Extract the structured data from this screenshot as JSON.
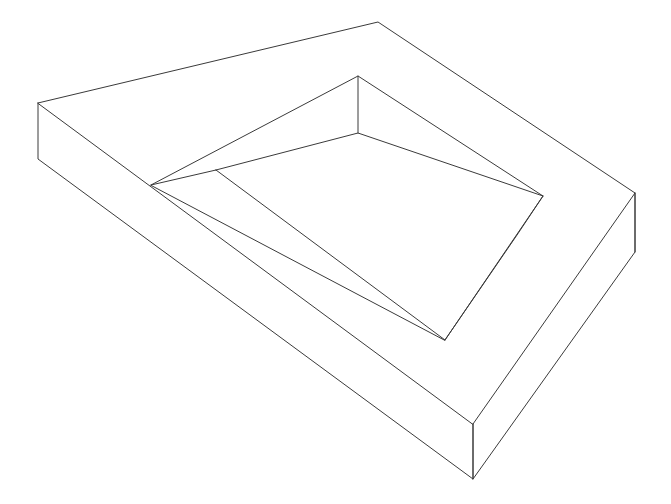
{
  "drawing": {
    "title": "Isometric rectangular tray",
    "description": "Wireframe line drawing of an open-top rectangular tray (pocketed block) shown in oblique isometric projection",
    "background_color": "#ffffff",
    "stroke_color": "#3a3a3a",
    "stroke_width": 1,
    "canvas": {
      "width": 671,
      "height": 504
    },
    "projection": "isometric",
    "extrusion_depth_px": 55
  },
  "chart_data": {
    "type": "line",
    "xlabel": "",
    "ylabel": "",
    "xlim": [
      0,
      671
    ],
    "ylim": [
      0,
      504
    ],
    "grid": false,
    "legend": "none",
    "vertices": {
      "outer_top_left": [
        38,
        103
      ],
      "outer_top_apex": [
        378,
        22
      ],
      "outer_top_right": [
        635,
        193
      ],
      "outer_top_bottom": [
        473,
        424
      ],
      "outer_base_left": [
        38,
        159
      ],
      "outer_base_right": [
        635,
        252
      ],
      "outer_base_bottom": [
        473,
        479
      ],
      "rim_left": [
        151,
        185
      ],
      "rim_apex": [
        358,
        76
      ],
      "rim_right": [
        543,
        196
      ],
      "rim_bottom": [
        445,
        340
      ],
      "wall_inner_apex": [
        358,
        133
      ],
      "floor_branch": [
        216,
        170
      ],
      "floor_right_corner": [
        517,
        235
      ]
    },
    "series": [
      {
        "name": "outer-top-face",
        "closed": true,
        "points": [
          [
            38,
            103
          ],
          [
            378,
            22
          ],
          [
            635,
            193
          ],
          [
            473,
            424
          ]
        ]
      },
      {
        "name": "outer-left-front-wall",
        "closed": false,
        "points": [
          [
            38,
            103
          ],
          [
            38,
            159
          ],
          [
            473,
            479
          ],
          [
            473,
            424
          ]
        ]
      },
      {
        "name": "outer-right-front-wall",
        "closed": false,
        "points": [
          [
            473,
            479
          ],
          [
            635,
            252
          ],
          [
            635,
            193
          ]
        ]
      },
      {
        "name": "outer-right-vertical-edge",
        "closed": false,
        "points": [
          [
            635,
            193
          ],
          [
            635,
            252
          ]
        ]
      },
      {
        "name": "outer-bottom-vertical-edge",
        "closed": false,
        "points": [
          [
            473,
            424
          ],
          [
            473,
            479
          ]
        ]
      },
      {
        "name": "pocket-rim",
        "closed": true,
        "points": [
          [
            151,
            185
          ],
          [
            358,
            76
          ],
          [
            543,
            196
          ],
          [
            445,
            340
          ]
        ]
      },
      {
        "name": "pocket-back-wall-vertical",
        "closed": false,
        "points": [
          [
            358,
            76
          ],
          [
            358,
            133
          ]
        ]
      },
      {
        "name": "pocket-floor-left-edge",
        "closed": false,
        "points": [
          [
            151,
            185
          ],
          [
            216,
            170
          ]
        ]
      },
      {
        "name": "pocket-floor-far-edge",
        "closed": false,
        "points": [
          [
            216,
            170
          ],
          [
            358,
            133
          ],
          [
            543,
            196
          ]
        ]
      },
      {
        "name": "pocket-floor-near-right-edge",
        "closed": false,
        "points": [
          [
            543,
            196
          ],
          [
            517,
            235
          ],
          [
            445,
            340
          ]
        ]
      },
      {
        "name": "pocket-floor-diagonal",
        "closed": false,
        "points": [
          [
            216,
            170
          ],
          [
            445,
            340
          ]
        ]
      }
    ]
  }
}
